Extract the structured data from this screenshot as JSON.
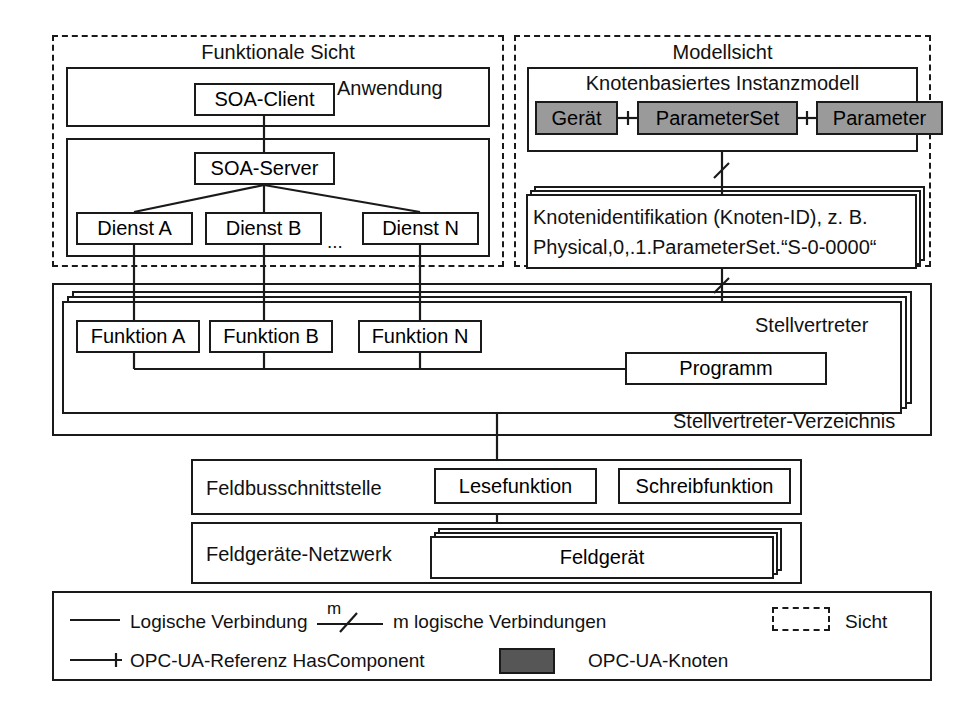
{
  "diagram": {
    "views": {
      "functional": {
        "label": "Funktionale Sicht",
        "application": {
          "label": "Anwendung",
          "soa_client": "SOA-Client"
        },
        "server_layer": {
          "soa_server": "SOA-Server",
          "services": [
            "Dienst A",
            "Dienst B",
            "Dienst N"
          ],
          "ellipsis": "..."
        }
      },
      "model": {
        "label": "Modellsicht",
        "instance_model": {
          "label": "Knotenbasiertes Instanzmodell",
          "nodes": [
            "Gerät",
            "ParameterSet",
            "Parameter"
          ]
        },
        "node_identification": {
          "line1": "Knotenidentifikation (Knoten-ID), z. B.",
          "line2": "Physical,0,.1.ParameterSet.“S-0-0000“"
        }
      }
    },
    "multiplicity_label": "m",
    "proxy_layer": {
      "proxy_label": "Stellvertreter",
      "directory_label": "Stellvertreter-Verzeichnis",
      "functions": [
        "Funktion A",
        "Funktion B",
        "Funktion N"
      ],
      "program": "Programm"
    },
    "fieldbus": {
      "label": "Feldbusschnittstelle",
      "read_function": "Lesefunktion",
      "write_function": "Schreibfunktion"
    },
    "fielddevice": {
      "label": "Feldgeräte-Netzwerk",
      "device": "Feldgerät"
    },
    "legend": {
      "row1": {
        "logical_connection": "Logische Verbindung",
        "m_connections": "m logische Verbindungen",
        "m_symbol": "m",
        "view": "Sicht"
      },
      "row2": {
        "reference": "OPC-UA-Referenz HasComponent",
        "node": "OPC-UA-Knoten"
      }
    },
    "colors": {
      "stroke": "#1a1a1a",
      "node_fill": "#9a9a9a",
      "background": "#ffffff"
    }
  }
}
